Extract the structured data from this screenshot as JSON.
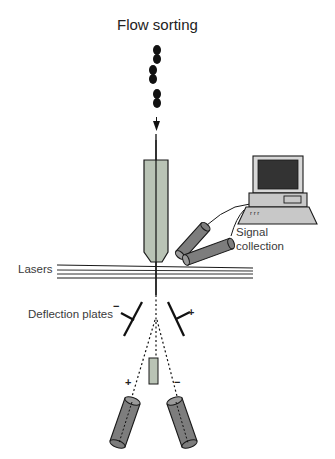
{
  "title": "Flow sorting",
  "labels": {
    "signal_collection_line1": "Signal",
    "signal_collection_line2": "collection",
    "lasers": "Lasers",
    "deflection_plates": "Deflection plates"
  },
  "polarity": {
    "left_plate": "−",
    "right_plate": "+",
    "left_stream": "+",
    "right_stream": "−"
  },
  "colors": {
    "nozzle_fill": "#b9c3b5",
    "detector_fill": "#7d7d7d",
    "screen_fill": "#333333",
    "computer_fill": "#c8c8c8",
    "stroke": "#1a1a1a",
    "text": "#3a3a3a"
  }
}
